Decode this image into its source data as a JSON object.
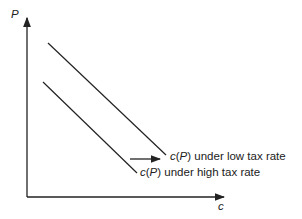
{
  "diagram": {
    "y_axis_label": "P",
    "x_axis_label": "c",
    "curves": [
      {
        "name": "c(P) under low tax rate",
        "label_func": "c",
        "label_arg": "P",
        "label_rest": " under low tax rate"
      },
      {
        "name": "c(P) under high tax rate",
        "label_func": "c",
        "label_arg": "P",
        "label_rest": " under high tax rate"
      }
    ],
    "annotation": "arrow indicating shift from high-tax curve to low-tax curve",
    "colors": {
      "line": "#222222",
      "background": "#ffffff"
    }
  }
}
